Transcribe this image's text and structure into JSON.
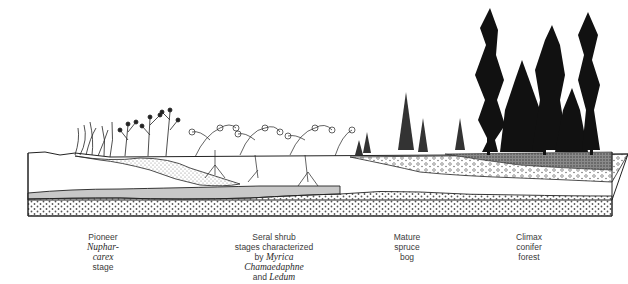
{
  "figure": {
    "colors": {
      "ink": "#1a1a1a",
      "paper": "#ffffff",
      "clay_band": "#c8c8c8",
      "peat_dark": "#6e6e6e"
    }
  },
  "stages": [
    {
      "id": "pioneer",
      "lines": [
        {
          "text": "Pioneer",
          "italic": false
        },
        {
          "text": "Nuphar-",
          "italic": true
        },
        {
          "text": "carex",
          "italic": true
        },
        {
          "text": "stage",
          "italic": false
        }
      ]
    },
    {
      "id": "seral-shrub",
      "lines": [
        {
          "text": "Seral shrub",
          "italic": false
        },
        {
          "text": "stages characterized",
          "italic": false
        },
        {
          "parts": [
            {
              "text": "by ",
              "italic": false
            },
            {
              "text": "Myrica",
              "italic": true
            }
          ]
        },
        {
          "text": "Chamaedaphne",
          "italic": true
        },
        {
          "parts": [
            {
              "text": "and ",
              "italic": false
            },
            {
              "text": "Ledum",
              "italic": true
            }
          ]
        }
      ]
    },
    {
      "id": "mature-spruce-bog",
      "lines": [
        {
          "text": "Mature",
          "italic": false
        },
        {
          "text": "spruce",
          "italic": false
        },
        {
          "text": "bog",
          "italic": false
        }
      ]
    },
    {
      "id": "climax-conifer-forest",
      "lines": [
        {
          "text": "Climax",
          "italic": false
        },
        {
          "text": "conifer",
          "italic": false
        },
        {
          "text": "forest",
          "italic": false
        }
      ]
    }
  ]
}
